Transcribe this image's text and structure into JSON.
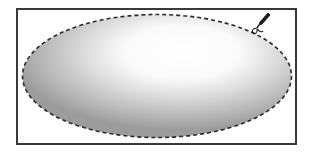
{
  "canvas": {
    "background": "#ffffff",
    "frame_color": "#3a3a3a"
  },
  "selection": {
    "shape": "ellipse",
    "style": "marching-ants-dashed",
    "stroke_color": "#2b2b2b",
    "fill_gradient": {
      "highlight": "#ffffff",
      "mid": "#d6d6d6",
      "shadow": "#9e9e9e"
    }
  },
  "cursor": {
    "icon": "lasso-pen-cursor-icon"
  }
}
